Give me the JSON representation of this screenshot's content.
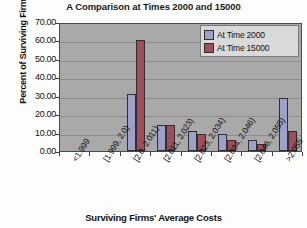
{
  "chart_data": {
    "type": "bar",
    "title": "A Comparison at Times 2000 and 15000",
    "xlabel": "Surviving Firms' Average Costs",
    "ylabel": "Percent of Surviving Firms",
    "categories": [
      "<1.999",
      "[1.999, 2.0)",
      "[2.0, 2.011)",
      "[2.011, 2.023)",
      "[2.023, 2.034)",
      "[2.034, 2.046)",
      "[2.046, 2.055)",
      ">2.055"
    ],
    "series": [
      {
        "name": "At Time 2000",
        "color": "#9fa0c8",
        "values": [
          0.0,
          0.0,
          31.0,
          14.0,
          11.0,
          9.0,
          6.0,
          28.5
        ]
      },
      {
        "name": "At Time 15000",
        "color": "#9d4e58",
        "values": [
          0.0,
          0.0,
          60.0,
          14.0,
          9.0,
          6.0,
          4.0,
          11.0
        ]
      }
    ],
    "ylim": [
      0,
      70
    ],
    "yticks": [
      "0.00",
      "10.00",
      "20.00",
      "30.00",
      "40.00",
      "50.00",
      "60.00",
      "70.00"
    ],
    "ytick_values": [
      0,
      10,
      20,
      30,
      40,
      50,
      60,
      70
    ],
    "grid": true,
    "legend_position": "top-right",
    "plot_background": "#a9a9a9"
  },
  "legend": {
    "entries": [
      {
        "label": "At Time 2000"
      },
      {
        "label": "At Time 15000"
      }
    ]
  }
}
